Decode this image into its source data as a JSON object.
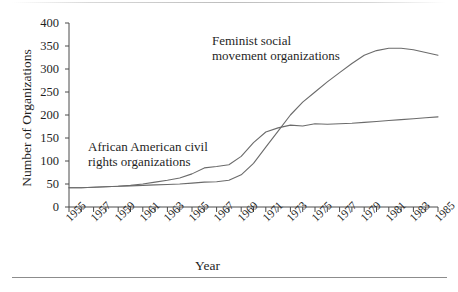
{
  "chart_data": {
    "type": "line",
    "title": "",
    "xlabel": "Year",
    "ylabel": "Number of Organizations",
    "xlim": [
      1955,
      1985
    ],
    "ylim": [
      0,
      400
    ],
    "ytick_step": 50,
    "grid": false,
    "legend_position": "inline-annotations",
    "yticks": [
      "0",
      "50",
      "100",
      "150",
      "200",
      "250",
      "300",
      "350",
      "400"
    ],
    "xticks": [
      "1955",
      "1957",
      "1959",
      "1961",
      "1963",
      "1965",
      "1967",
      "1969",
      "1971",
      "1973",
      "1975",
      "1977",
      "1979",
      "1981",
      "1983",
      "1985"
    ],
    "x": [
      1955,
      1956,
      1957,
      1958,
      1959,
      1960,
      1961,
      1962,
      1963,
      1964,
      1965,
      1966,
      1967,
      1968,
      1969,
      1970,
      1971,
      1972,
      1973,
      1974,
      1975,
      1976,
      1977,
      1978,
      1979,
      1980,
      1981,
      1982,
      1983,
      1984,
      1985
    ],
    "series": [
      {
        "name": "Feminist social movement organizations",
        "color": "#6b6b6b",
        "values": [
          42,
          42,
          43,
          44,
          45,
          46,
          47,
          48,
          49,
          50,
          52,
          54,
          55,
          58,
          70,
          95,
          130,
          165,
          200,
          228,
          250,
          272,
          292,
          312,
          330,
          340,
          345,
          345,
          342,
          336,
          330
        ]
      },
      {
        "name": "African American civil rights organizations",
        "color": "#6b6b6b",
        "values": [
          42,
          42,
          43,
          44,
          45,
          47,
          50,
          54,
          58,
          63,
          72,
          85,
          88,
          92,
          110,
          140,
          163,
          172,
          178,
          176,
          181,
          180,
          181,
          182,
          184,
          186,
          188,
          190,
          192,
          194,
          196
        ]
      }
    ],
    "annotations": [
      {
        "id": "feminist",
        "text": "Feminist social\nmovement organizations"
      },
      {
        "id": "civil-rights",
        "text": "African American civil\nrights organizations"
      }
    ]
  }
}
